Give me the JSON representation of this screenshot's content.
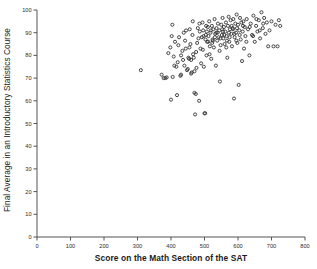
{
  "chart_data": {
    "type": "scatter",
    "title": "",
    "xlabel": "Score on the Math Section of the SAT",
    "ylabel": "Final Average in an Introductory Statistics Course",
    "xlim": [
      0,
      800
    ],
    "ylim": [
      0,
      100
    ],
    "xticks": [
      0,
      100,
      200,
      300,
      400,
      500,
      600,
      700,
      800
    ],
    "yticks": [
      0,
      10,
      20,
      30,
      40,
      50,
      60,
      70,
      80,
      90,
      100
    ],
    "grid": false,
    "legend": null,
    "marker": {
      "shape": "open-circle",
      "size": 3.1,
      "edge_color": "#333333",
      "fill_color": "none"
    },
    "series": [
      {
        "name": "students",
        "points": [
          [
            310,
            73.5
          ],
          [
            372,
            71.5
          ],
          [
            378,
            70.0
          ],
          [
            383,
            70.0
          ],
          [
            387,
            70.3
          ],
          [
            392,
            81.0
          ],
          [
            398,
            83.5
          ],
          [
            400,
            60.5
          ],
          [
            402,
            88.5
          ],
          [
            404,
            93.5
          ],
          [
            408,
            79.5
          ],
          [
            412,
            86.0
          ],
          [
            416,
            75.0
          ],
          [
            418,
            62.5
          ],
          [
            422,
            84.5
          ],
          [
            424,
            88.0
          ],
          [
            428,
            71.0
          ],
          [
            430,
            71.5
          ],
          [
            434,
            82.0
          ],
          [
            436,
            78.0
          ],
          [
            438,
            90.0
          ],
          [
            442,
            86.5
          ],
          [
            444,
            83.0
          ],
          [
            448,
            73.5
          ],
          [
            452,
            79.0
          ],
          [
            454,
            78.5
          ],
          [
            456,
            91.5
          ],
          [
            458,
            85.0
          ],
          [
            460,
            78.0
          ],
          [
            462,
            72.5
          ],
          [
            464,
            89.0
          ],
          [
            466,
            80.5
          ],
          [
            468,
            79.0
          ],
          [
            470,
            63.5
          ],
          [
            472,
            54.0
          ],
          [
            474,
            63.0
          ],
          [
            476,
            74.5
          ],
          [
            478,
            85.5
          ],
          [
            480,
            92.0
          ],
          [
            482,
            87.5
          ],
          [
            484,
            60.0
          ],
          [
            486,
            90.5
          ],
          [
            488,
            83.0
          ],
          [
            490,
            76.5
          ],
          [
            492,
            88.0
          ],
          [
            494,
            94.5
          ],
          [
            496,
            91.0
          ],
          [
            498,
            75.0
          ],
          [
            500,
            54.5
          ],
          [
            502,
            54.5
          ],
          [
            504,
            89.0
          ],
          [
            506,
            80.0
          ],
          [
            508,
            86.0
          ],
          [
            510,
            92.5
          ],
          [
            512,
            88.5
          ],
          [
            514,
            95.0
          ],
          [
            516,
            84.0
          ],
          [
            518,
            90.0
          ],
          [
            520,
            78.5
          ],
          [
            522,
            93.0
          ],
          [
            524,
            87.0
          ],
          [
            526,
            91.5
          ],
          [
            528,
            83.5
          ],
          [
            530,
            96.0
          ],
          [
            532,
            89.5
          ],
          [
            534,
            75.5
          ],
          [
            536,
            92.0
          ],
          [
            538,
            86.5
          ],
          [
            540,
            94.0
          ],
          [
            542,
            88.0
          ],
          [
            544,
            91.0
          ],
          [
            546,
            68.5
          ],
          [
            548,
            84.5
          ],
          [
            550,
            93.5
          ],
          [
            552,
            89.0
          ],
          [
            554,
            96.5
          ],
          [
            556,
            87.5
          ],
          [
            558,
            92.5
          ],
          [
            560,
            85.0
          ],
          [
            562,
            90.5
          ],
          [
            564,
            94.5
          ],
          [
            566,
            88.5
          ],
          [
            568,
            79.0
          ],
          [
            570,
            93.0
          ],
          [
            572,
            97.0
          ],
          [
            574,
            86.0
          ],
          [
            576,
            91.5
          ],
          [
            578,
            95.5
          ],
          [
            580,
            89.5
          ],
          [
            582,
            84.0
          ],
          [
            584,
            92.0
          ],
          [
            586,
            96.0
          ],
          [
            588,
            61.0
          ],
          [
            590,
            88.0
          ],
          [
            592,
            94.0
          ],
          [
            594,
            90.0
          ],
          [
            596,
            98.0
          ],
          [
            598,
            85.5
          ],
          [
            600,
            93.5
          ],
          [
            602,
            67.0
          ],
          [
            604,
            91.0
          ],
          [
            606,
            96.5
          ],
          [
            608,
            87.0
          ],
          [
            610,
            94.5
          ],
          [
            612,
            77.5
          ],
          [
            614,
            90.5
          ],
          [
            616,
            95.0
          ],
          [
            618,
            83.0
          ],
          [
            620,
            92.5
          ],
          [
            622,
            88.5
          ],
          [
            626,
            96.0
          ],
          [
            630,
            91.5
          ],
          [
            634,
            80.0
          ],
          [
            638,
            94.0
          ],
          [
            642,
            89.0
          ],
          [
            646,
            97.5
          ],
          [
            650,
            86.0
          ],
          [
            654,
            93.0
          ],
          [
            658,
            90.5
          ],
          [
            662,
            95.5
          ],
          [
            666,
            87.5
          ],
          [
            670,
            99.0
          ],
          [
            674,
            92.0
          ],
          [
            678,
            96.5
          ],
          [
            682,
            89.5
          ],
          [
            686,
            94.5
          ],
          [
            690,
            84.0
          ],
          [
            694,
            91.0
          ],
          [
            700,
            95.0
          ],
          [
            706,
            84.0
          ],
          [
            712,
            93.5
          ],
          [
            718,
            84.0
          ],
          [
            722,
            95.5
          ],
          [
            726,
            93.0
          ],
          [
            445,
            91.0
          ],
          [
            455,
            83.5
          ],
          [
            465,
            95.0
          ],
          [
            475,
            81.5
          ],
          [
            485,
            94.0
          ],
          [
            495,
            82.5
          ],
          [
            505,
            93.0
          ],
          [
            515,
            80.5
          ],
          [
            525,
            86.5
          ],
          [
            535,
            90.0
          ],
          [
            545,
            82.0
          ],
          [
            555,
            90.5
          ],
          [
            565,
            83.5
          ],
          [
            575,
            88.0
          ],
          [
            585,
            91.5
          ],
          [
            595,
            86.5
          ],
          [
            605,
            89.0
          ],
          [
            615,
            93.0
          ],
          [
            625,
            86.0
          ],
          [
            635,
            92.5
          ],
          [
            645,
            88.5
          ],
          [
            655,
            96.0
          ],
          [
            665,
            91.0
          ],
          [
            675,
            94.0
          ],
          [
            497,
            88.5
          ],
          [
            503,
            87.0
          ],
          [
            507,
            90.5
          ],
          [
            511,
            86.0
          ],
          [
            519,
            91.0
          ],
          [
            523,
            85.5
          ],
          [
            531,
            88.0
          ],
          [
            539,
            90.0
          ],
          [
            547,
            87.5
          ],
          [
            553,
            91.5
          ],
          [
            559,
            89.0
          ],
          [
            567,
            86.5
          ],
          [
            573,
            90.0
          ],
          [
            581,
            93.0
          ],
          [
            589,
            89.5
          ],
          [
            597,
            92.0
          ],
          [
            440,
            75.5
          ],
          [
            450,
            74.0
          ],
          [
            460,
            72.0
          ],
          [
            470,
            73.0
          ],
          [
            430,
            80.0
          ],
          [
            420,
            77.0
          ],
          [
            410,
            75.5
          ],
          [
            405,
            70.5
          ]
        ]
      }
    ]
  },
  "axis": {
    "x_tick_labels": [
      "0",
      "100",
      "200",
      "300",
      "400",
      "500",
      "600",
      "700",
      "800"
    ],
    "y_tick_labels": [
      "0",
      "10",
      "20",
      "30",
      "40",
      "50",
      "60",
      "70",
      "80",
      "90",
      "100"
    ]
  }
}
